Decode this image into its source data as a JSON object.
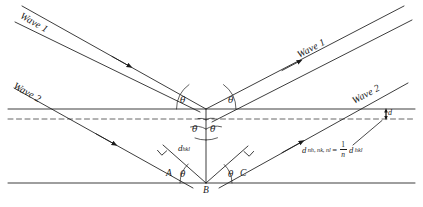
{
  "figure": {
    "type": "bragg-diffraction-diagram",
    "title": "",
    "labels": {
      "wave1_incoming": "Wave 1",
      "wave1_outgoing": "Wave 1",
      "wave2_incoming": "Wave 2",
      "wave2_outgoing": "Wave 2",
      "theta": "θ",
      "point_a": "A",
      "point_b": "B",
      "point_c": "C",
      "d_spacing": "d",
      "d_spacing_sub": "hkl",
      "d_small": "d"
    },
    "equation": {
      "lhs_symbol": "d",
      "lhs_sub": "nh, nk, nl",
      "equals": "=",
      "frac_num": "1",
      "frac_den": "n",
      "rhs_symbol": "d",
      "rhs_sub": "hkl"
    },
    "angles": {
      "theta_top_left": "θ",
      "theta_top_right": "θ",
      "theta_mid_left": "θ",
      "theta_mid_right": "θ",
      "theta_bottom_left": "θ",
      "theta_bottom_right": "θ"
    },
    "colors": {
      "line": "#1a1a1a",
      "background": "#ffffff",
      "dashed": "#555555"
    },
    "geometry": {
      "apex_x": 206,
      "apex_y": 109,
      "point_b_x": 206,
      "point_b_y": 183,
      "point_a_x": 163,
      "point_a_y": 183,
      "point_c_x": 247,
      "point_c_y": 183,
      "top_plane_y": 109,
      "dashed_plane_y": 119,
      "bottom_plane_y": 183
    }
  }
}
